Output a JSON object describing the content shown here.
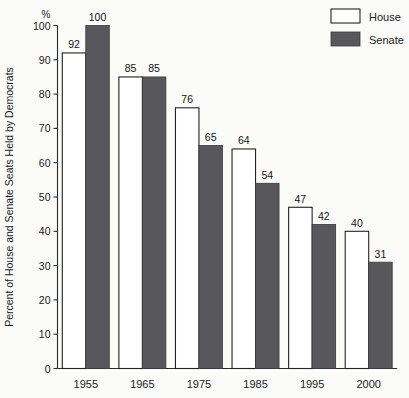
{
  "chart_data": {
    "type": "bar",
    "title": "",
    "xlabel": "",
    "ylabel": "Percent of House and Senate Seats Held by Democrats",
    "yunit": "%",
    "ylim": [
      0,
      100
    ],
    "yticks": [
      0,
      10,
      20,
      30,
      40,
      50,
      60,
      70,
      80,
      90,
      100
    ],
    "ytick_labels": [
      "0",
      "10",
      "20",
      "30",
      "40",
      "50",
      "60",
      "70",
      "80",
      "90",
      "100"
    ],
    "grid": false,
    "legend_position": "top-right",
    "categories": [
      "1955",
      "1965",
      "1975",
      "1985",
      "1995",
      "2000"
    ],
    "series": [
      {
        "name": "House",
        "color": "#ffffff",
        "values": [
          92,
          85,
          76,
          64,
          47,
          40
        ],
        "value_labels": [
          "92",
          "85",
          "76",
          "64",
          "47",
          "40"
        ]
      },
      {
        "name": "Senate",
        "color": "#58585a",
        "values": [
          100,
          85,
          65,
          54,
          42,
          31
        ],
        "value_labels": [
          "100",
          "85",
          "65",
          "54",
          "42",
          "31"
        ]
      }
    ]
  },
  "legend": {
    "items": [
      {
        "label": "House",
        "swatch": "white-outlined-swatch"
      },
      {
        "label": "Senate",
        "swatch": "dark-gray-filled-swatch"
      }
    ]
  },
  "colors": {
    "house_fill": "#ffffff",
    "senate_fill": "#58585a",
    "outline": "#232323",
    "background": "#fbfbfa",
    "text": "#1a1a1a"
  }
}
